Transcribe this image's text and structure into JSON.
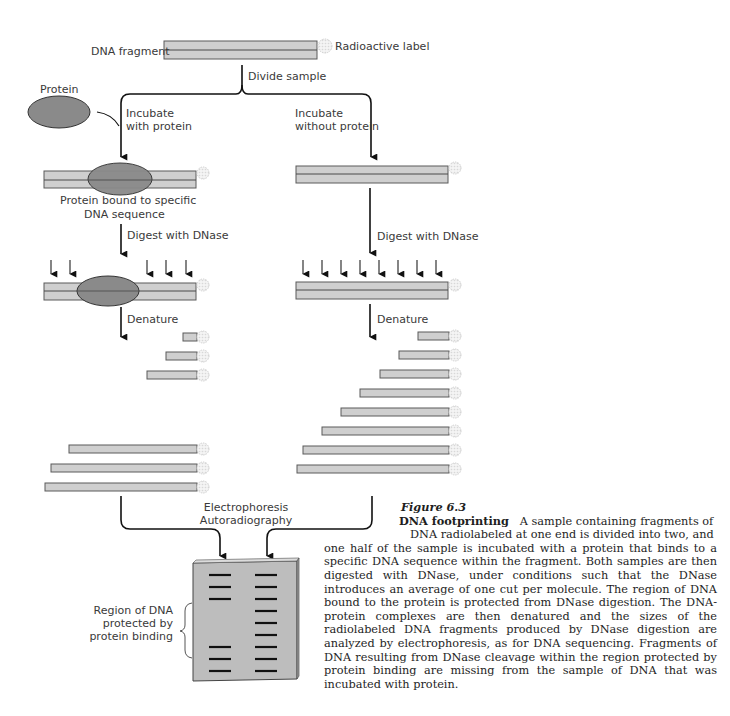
{
  "labels": {
    "dna_fragment": "DNA fragment",
    "radioactive_label": "Radioactive label",
    "divide_sample": "Divide sample",
    "protein": "Protein",
    "incubate_with_1": "Incubate",
    "incubate_with_2": "with protein",
    "incubate_without_1": "Incubate",
    "incubate_without_2": "without protein",
    "protein_bound_1": "Protein bound to specific",
    "protein_bound_2": "DNA sequence",
    "digest_left": "Digest with DNase",
    "digest_right": "Digest with DNase",
    "denature_left": "Denature",
    "denature_right": "Denature",
    "electrophoresis": "Electrophoresis",
    "autoradiography": "Autoradiography",
    "region_1": "Region of DNA",
    "region_2": "protected by",
    "region_3": "protein binding"
  },
  "caption": {
    "figure_number": "Figure 6.3",
    "title": "DNA footprinting",
    "line1": "A sample containing fragments of",
    "line2": "DNA radiolabeled at one end is divided into two, and",
    "body": "one half of the sample is incubated with a protein that binds to a specific DNA sequence within the fragment. Both samples are then digested with DNase, under conditions such that the DNase introduces an average of one cut per molecule. The region of DNA bound to the protein is protected from DNase digestion. The DNA-protein complexes are then denatured and the sizes of the radiolabeled DNA fragments produced by DNase digestion are analyzed by electrophoresis, as for DNA sequencing. Fragments of DNA resulting from DNase cleavage within the region protected by protein binding are missing from the sample of DNA that was incubated with protein."
  },
  "colors": {
    "dna_fill": "#cfcfcf",
    "dna_stroke": "#5a5a5a",
    "protein_fill": "#8a8a8a",
    "gel_fill": "#bdbdbd",
    "band": "#111111",
    "arrow": "#111111",
    "label_halo": "#e6e6e6"
  },
  "fragments": {
    "left_denatured_starts": [
      183,
      166,
      147
    ],
    "left_long_starts": [
      69,
      51,
      45
    ],
    "right_starts": [
      418,
      399,
      380,
      360,
      341,
      322,
      303,
      297
    ]
  },
  "gel": {
    "lane_left_bands": [
      1,
      2,
      3,
      7,
      8,
      9
    ],
    "lane_right_bands": [
      1,
      2,
      3,
      4,
      5,
      6,
      7,
      8,
      9
    ]
  }
}
